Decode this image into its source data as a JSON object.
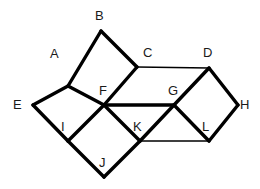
{
  "figure": {
    "background_color": "#ffffff",
    "stroke_color": "#000000",
    "label_color": "#1a1a1a",
    "canvas": {
      "width": 260,
      "height": 189
    },
    "vertices": [
      {
        "id": "A",
        "label": "A",
        "x": 68,
        "y": 86,
        "label_x": 50,
        "label_y": 47
      },
      {
        "id": "B",
        "label": "B",
        "x": 101,
        "y": 31,
        "label_x": 95,
        "label_y": 9
      },
      {
        "id": "C",
        "label": "C",
        "x": 137,
        "y": 67,
        "label_x": 143,
        "label_y": 46
      },
      {
        "id": "D",
        "label": "D",
        "x": 209,
        "y": 68,
        "label_x": 203,
        "label_y": 46
      },
      {
        "id": "E",
        "label": "E",
        "x": 33,
        "y": 105,
        "label_x": 13,
        "label_y": 98
      },
      {
        "id": "F",
        "label": "F",
        "x": 104,
        "y": 105,
        "label_x": 99,
        "label_y": 84
      },
      {
        "id": "G",
        "label": "G",
        "x": 174,
        "y": 105,
        "label_x": 168,
        "label_y": 84
      },
      {
        "id": "H",
        "label": "H",
        "x": 238,
        "y": 105,
        "label_x": 240,
        "label_y": 98
      },
      {
        "id": "I",
        "label": "I",
        "x": 68,
        "y": 141,
        "label_x": 61,
        "label_y": 120
      },
      {
        "id": "J",
        "label": "J",
        "x": 104,
        "y": 177,
        "label_x": 99,
        "label_y": 156
      },
      {
        "id": "K",
        "label": "K",
        "x": 140,
        "y": 141,
        "label_x": 133,
        "label_y": 120
      },
      {
        "id": "L",
        "label": "L",
        "x": 209,
        "y": 141,
        "label_x": 202,
        "label_y": 120
      }
    ],
    "edges": [
      {
        "id": "A-B",
        "from": "A",
        "to": "B",
        "weight": "thick"
      },
      {
        "id": "B-C",
        "from": "B",
        "to": "C",
        "weight": "thick"
      },
      {
        "id": "A-F",
        "from": "A",
        "to": "F",
        "weight": "thick"
      },
      {
        "id": "F-C",
        "from": "F",
        "to": "C",
        "weight": "thick"
      },
      {
        "id": "A-E",
        "from": "A",
        "to": "E",
        "weight": "thick"
      },
      {
        "id": "E-I",
        "from": "E",
        "to": "I",
        "weight": "thick"
      },
      {
        "id": "I-F",
        "from": "I",
        "to": "F",
        "weight": "thick"
      },
      {
        "id": "I-J",
        "from": "I",
        "to": "J",
        "weight": "thick"
      },
      {
        "id": "J-K",
        "from": "J",
        "to": "K",
        "weight": "thick"
      },
      {
        "id": "F-K",
        "from": "F",
        "to": "K",
        "weight": "thick"
      },
      {
        "id": "C-D",
        "from": "C",
        "to": "D",
        "weight": "thin"
      },
      {
        "id": "F-G",
        "from": "F",
        "to": "G",
        "weight": "thick"
      },
      {
        "id": "D-G",
        "from": "D",
        "to": "G",
        "weight": "thick"
      },
      {
        "id": "D-H",
        "from": "D",
        "to": "H",
        "weight": "thick"
      },
      {
        "id": "H-L",
        "from": "H",
        "to": "L",
        "weight": "thick"
      },
      {
        "id": "G-L",
        "from": "G",
        "to": "L",
        "weight": "thick"
      },
      {
        "id": "G-K",
        "from": "G",
        "to": "K",
        "weight": "thick"
      },
      {
        "id": "K-L",
        "from": "K",
        "to": "L",
        "weight": "thin"
      }
    ]
  }
}
